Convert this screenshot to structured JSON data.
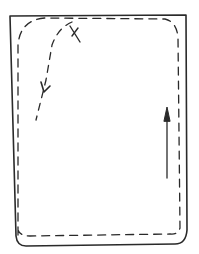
{
  "sketch": {
    "description": "Hand-drawn rectangular field with dashed inner path, an X marker, and arrows",
    "marker_label": "X",
    "colors": {
      "ink": "#2a2a2a",
      "background": "#ffffff"
    }
  }
}
